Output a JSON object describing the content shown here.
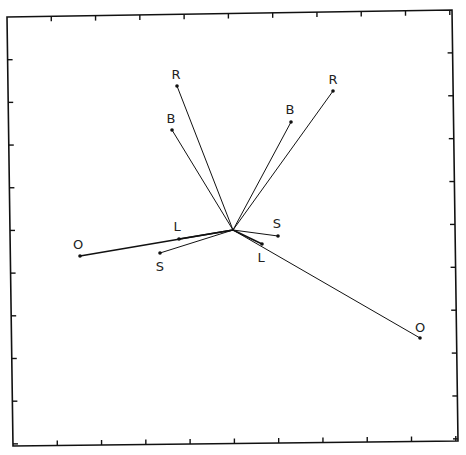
{
  "diagram": {
    "type": "vector-plot",
    "frame": {
      "corners": {
        "top_left": [
          7,
          17
        ],
        "top_right": [
          452,
          10
        ],
        "bottom_right": [
          458,
          441
        ],
        "bottom_left": [
          13,
          446
        ]
      },
      "ticks_per_side": 10
    },
    "origin": [
      233,
      230
    ],
    "vectors": [
      {
        "label": "R",
        "point": [
          177,
          86
        ],
        "label_pos": [
          176,
          79
        ],
        "group": "left"
      },
      {
        "label": "B",
        "point": [
          172,
          130
        ],
        "label_pos": [
          171,
          123
        ],
        "group": "left"
      },
      {
        "label": "B",
        "point": [
          291,
          122
        ],
        "label_pos": [
          290,
          114
        ],
        "group": "right"
      },
      {
        "label": "R",
        "point": [
          333,
          91
        ],
        "label_pos": [
          333,
          84
        ],
        "group": "right"
      },
      {
        "label": "O",
        "point": [
          80,
          256
        ],
        "label_pos": [
          78,
          249
        ],
        "group": "left",
        "thick": true
      },
      {
        "label": "L",
        "point": [
          179,
          239
        ],
        "label_pos": [
          177,
          231
        ],
        "group": "left",
        "thick": true
      },
      {
        "label": "S",
        "point": [
          160,
          253
        ],
        "label_pos": [
          160,
          271
        ],
        "group": "left"
      },
      {
        "label": "S",
        "point": [
          278,
          236
        ],
        "label_pos": [
          277,
          228
        ],
        "group": "right"
      },
      {
        "label": "L",
        "point": [
          262,
          244
        ],
        "label_pos": [
          261,
          262
        ],
        "group": "right",
        "thick": true
      },
      {
        "label": "O",
        "point": [
          420,
          338
        ],
        "label_pos": [
          420,
          332
        ],
        "group": "right"
      }
    ],
    "colors": {
      "line": "#111111",
      "background": "#ffffff",
      "text": "#222222"
    }
  }
}
